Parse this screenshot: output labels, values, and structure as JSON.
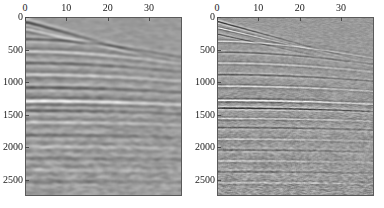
{
  "figure": {
    "title": "",
    "background_color": "#ffffff",
    "width": 384,
    "height": 208
  },
  "chart_data": {
    "type": "heatmap",
    "title": "",
    "subtitle": "",
    "panel_count": 2,
    "colormap": "gray",
    "colormap_low_color": "#000000",
    "colormap_mid_color": "#9a9a9a",
    "colormap_high_color": "#ffffff",
    "amplitude_range": [
      -1,
      1
    ],
    "panels": [
      {
        "id": "left",
        "label": "",
        "xlabel": "",
        "ylabel": "",
        "xlim": [
          0,
          38
        ],
        "ylim": [
          0,
          2750
        ],
        "y_inverted": true,
        "grid": false,
        "x_axis_position": "top",
        "y_axis_position": "left",
        "xticks": [
          0,
          10,
          20,
          30
        ],
        "xticklabels": [
          "0",
          "10",
          "20",
          "30"
        ],
        "yticks": [
          0,
          500,
          1000,
          1500,
          2000,
          2500
        ],
        "yticklabels": [
          "0",
          "500",
          "1000",
          "1500",
          "2000",
          "2500"
        ],
        "events": [
          {
            "name": "direct-arrival",
            "t0": 60,
            "velocity": 1450,
            "amplitude": -1.0,
            "width": 34,
            "type": "linear"
          },
          {
            "name": "first-refraction",
            "t0": 170,
            "velocity": 1750,
            "amplitude": 0.85,
            "width": 26,
            "type": "linear"
          },
          {
            "name": "reflection-1",
            "t0": 330,
            "velocity": 1850,
            "amplitude": -0.75,
            "width": 30,
            "type": "hyperbolic"
          },
          {
            "name": "reflection-2",
            "t0": 520,
            "velocity": 1950,
            "amplitude": 0.7,
            "width": 34,
            "type": "hyperbolic"
          },
          {
            "name": "reflection-3",
            "t0": 700,
            "velocity": 2050,
            "amplitude": -0.6,
            "width": 36,
            "type": "hyperbolic"
          },
          {
            "name": "reflection-4",
            "t0": 880,
            "velocity": 2150,
            "amplitude": 0.65,
            "width": 38,
            "type": "hyperbolic"
          },
          {
            "name": "reflection-5",
            "t0": 1080,
            "velocity": 2250,
            "amplitude": -0.7,
            "width": 38,
            "type": "hyperbolic"
          },
          {
            "name": "bright-reflector",
            "t0": 1290,
            "velocity": 2400,
            "amplitude": 1.0,
            "width": 42,
            "type": "hyperbolic"
          },
          {
            "name": "reflection-6",
            "t0": 1440,
            "velocity": 2450,
            "amplitude": -0.55,
            "width": 40,
            "type": "hyperbolic"
          },
          {
            "name": "reflection-7",
            "t0": 1620,
            "velocity": 2550,
            "amplitude": 0.5,
            "width": 40,
            "type": "hyperbolic"
          },
          {
            "name": "reflection-8",
            "t0": 1820,
            "velocity": 2650,
            "amplitude": -0.4,
            "width": 42,
            "type": "hyperbolic"
          },
          {
            "name": "reflection-9",
            "t0": 2000,
            "velocity": 2720,
            "amplitude": 0.38,
            "width": 44,
            "type": "hyperbolic"
          },
          {
            "name": "reflection-10",
            "t0": 2180,
            "velocity": 2800,
            "amplitude": -0.34,
            "width": 44,
            "type": "hyperbolic"
          },
          {
            "name": "reflection-11",
            "t0": 2360,
            "velocity": 2880,
            "amplitude": 0.3,
            "width": 46,
            "type": "hyperbolic"
          },
          {
            "name": "reflection-12",
            "t0": 2540,
            "velocity": 2950,
            "amplitude": -0.28,
            "width": 46,
            "type": "hyperbolic"
          }
        ],
        "noise_level": 0.22,
        "smoothing": "high",
        "appearance": "blurred / low-resolution, events smeared, weak deep reflectors"
      },
      {
        "id": "right",
        "label": "",
        "xlabel": "",
        "ylabel": "",
        "xlim": [
          0,
          38
        ],
        "ylim": [
          0,
          2750
        ],
        "y_inverted": true,
        "grid": false,
        "x_axis_position": "top",
        "y_axis_position": "left",
        "xticks": [
          0,
          10,
          20,
          30
        ],
        "xticklabels": [
          "0",
          "10",
          "20",
          "30"
        ],
        "yticks": [
          0,
          500,
          1000,
          1500,
          2000,
          2500
        ],
        "yticklabels": [
          "0",
          "500",
          "1000",
          "1500",
          "2000",
          "2500"
        ],
        "events": [
          {
            "name": "direct-arrival",
            "t0": 55,
            "velocity": 1450,
            "amplitude": -1.0,
            "width": 18,
            "type": "linear"
          },
          {
            "name": "first-refraction",
            "t0": 150,
            "velocity": 1700,
            "amplitude": 0.95,
            "width": 15,
            "type": "linear"
          },
          {
            "name": "refraction-2",
            "t0": 250,
            "velocity": 1800,
            "amplitude": -0.8,
            "width": 16,
            "type": "linear"
          },
          {
            "name": "reflection-1",
            "t0": 360,
            "velocity": 1880,
            "amplitude": 0.8,
            "width": 17,
            "type": "hyperbolic"
          },
          {
            "name": "reflection-2",
            "t0": 530,
            "velocity": 1960,
            "amplitude": -0.8,
            "width": 18,
            "type": "hyperbolic"
          },
          {
            "name": "reflection-3",
            "t0": 700,
            "velocity": 2060,
            "amplitude": 0.75,
            "width": 19,
            "type": "hyperbolic"
          },
          {
            "name": "reflection-4",
            "t0": 880,
            "velocity": 2160,
            "amplitude": -0.8,
            "width": 20,
            "type": "hyperbolic"
          },
          {
            "name": "reflection-5",
            "t0": 1060,
            "velocity": 2260,
            "amplitude": 0.8,
            "width": 20,
            "type": "hyperbolic"
          },
          {
            "name": "bright-reflector",
            "t0": 1280,
            "velocity": 2400,
            "amplitude": 1.0,
            "width": 22,
            "type": "hyperbolic"
          },
          {
            "name": "strong-dark-reflector",
            "t0": 1400,
            "velocity": 2450,
            "amplitude": -1.0,
            "width": 20,
            "type": "hyperbolic"
          },
          {
            "name": "reflection-6",
            "t0": 1560,
            "velocity": 2520,
            "amplitude": 0.6,
            "width": 20,
            "type": "hyperbolic"
          },
          {
            "name": "reflection-7",
            "t0": 1700,
            "velocity": 2600,
            "amplitude": -0.65,
            "width": 22,
            "type": "hyperbolic"
          },
          {
            "name": "reflection-8",
            "t0": 1880,
            "velocity": 2680,
            "amplitude": 0.55,
            "width": 22,
            "type": "hyperbolic"
          },
          {
            "name": "reflection-9",
            "t0": 2050,
            "velocity": 2760,
            "amplitude": -0.55,
            "width": 23,
            "type": "hyperbolic"
          },
          {
            "name": "reflection-10",
            "t0": 2220,
            "velocity": 2840,
            "amplitude": 0.5,
            "width": 23,
            "type": "hyperbolic"
          },
          {
            "name": "reflection-11",
            "t0": 2390,
            "velocity": 2910,
            "amplitude": -0.48,
            "width": 24,
            "type": "hyperbolic"
          },
          {
            "name": "reflection-12",
            "t0": 2560,
            "velocity": 2980,
            "amplitude": 0.45,
            "width": 24,
            "type": "hyperbolic"
          }
        ],
        "noise_level": 0.26,
        "smoothing": "low",
        "appearance": "sharper / higher resolution, crisp continuous reflectors, visible deep events"
      }
    ]
  }
}
